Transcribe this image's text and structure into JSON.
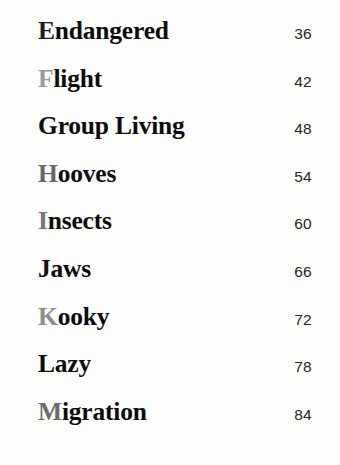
{
  "document": {
    "type": "book-table-of-contents",
    "background_color": "#fdfdfc",
    "title_color": "#0c0c0c",
    "page_number_color": "#262626"
  },
  "contents": {
    "entries": [
      {
        "initial": "E",
        "rest": "ndangered",
        "title": "Endangered",
        "page": "36",
        "initial_color": "#1e1e1e"
      },
      {
        "initial": "F",
        "rest": "light",
        "title": "Flight",
        "page": "42",
        "initial_color": "#9a9a9a"
      },
      {
        "initial": "G",
        "rest": "roup Living",
        "title": "Group Living",
        "page": "48",
        "initial_color": "#0c0c0c"
      },
      {
        "initial": "H",
        "rest": "ooves",
        "title": "Hooves",
        "page": "54",
        "initial_color": "#666666"
      },
      {
        "initial": "I",
        "rest": "nsects",
        "title": "Insects",
        "page": "60",
        "initial_color": "#777777"
      },
      {
        "initial": "J",
        "rest": "aws",
        "title": "Jaws",
        "page": "66",
        "initial_color": "#121212"
      },
      {
        "initial": "K",
        "rest": "ooky",
        "title": "Kooky",
        "page": "72",
        "initial_color": "#8e8e8e"
      },
      {
        "initial": "L",
        "rest": "azy",
        "title": "Lazy",
        "page": "78",
        "initial_color": "#0c0c0c"
      },
      {
        "initial": "M",
        "rest": "igration",
        "title": "Migration",
        "page": "84",
        "initial_color": "#6a6a6a"
      }
    ]
  }
}
